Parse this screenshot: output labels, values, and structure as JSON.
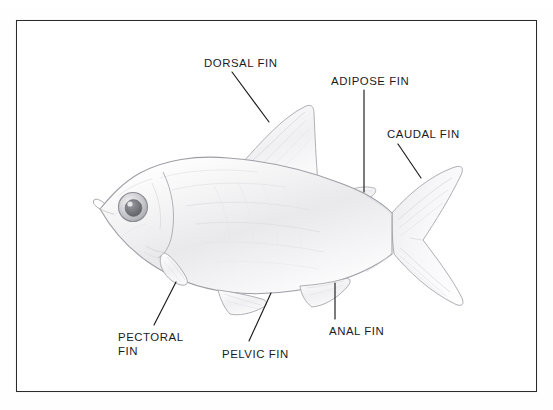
{
  "document": {
    "type": "pencil-drawing-diagram",
    "subject": "Fish external anatomy — fin identification",
    "background_color": "#ffffff",
    "frame_color": "#2b2b2d",
    "ink_color": "#1b1b1d",
    "pencil_color": "#b9babd"
  },
  "scan": {
    "top_sliver_text": "  "
  },
  "labels": [
    {
      "id": "dorsal",
      "text": "DORSAL FIN",
      "lines": [
        "DORSAL FIN"
      ],
      "x": 204,
      "y": 57,
      "leader": {
        "x1": 232,
        "y1": 72,
        "x2": 269,
        "y2": 122
      }
    },
    {
      "id": "adipose",
      "text": "ADIPOSE FIN",
      "lines": [
        "ADIPOSE FIN"
      ],
      "x": 331,
      "y": 75,
      "leader": {
        "x1": 364,
        "y1": 90,
        "x2": 364,
        "y2": 192
      }
    },
    {
      "id": "caudal",
      "text": "CAUDAL FIN",
      "lines": [
        "CAUDAL FIN"
      ],
      "x": 387,
      "y": 128,
      "leader": {
        "x1": 398,
        "y1": 144,
        "x2": 421,
        "y2": 178
      }
    },
    {
      "id": "pectoral",
      "text": "PECTORAL FIN",
      "lines": [
        "PECTORAL",
        "FIN"
      ],
      "x": 118,
      "y": 331,
      "leader": {
        "x1": 176,
        "y1": 282,
        "x2": 154,
        "y2": 325
      }
    },
    {
      "id": "pelvic",
      "text": "PELVIC FIN",
      "lines": [
        "PELVIC FIN"
      ],
      "x": 222,
      "y": 348,
      "leader": {
        "x1": 271,
        "y1": 293,
        "x2": 249,
        "y2": 341
      }
    },
    {
      "id": "anal",
      "text": "ANAL FIN",
      "lines": [
        "ANAL FIN"
      ],
      "x": 329,
      "y": 325,
      "leader": {
        "x1": 335,
        "y1": 283,
        "x2": 335,
        "y2": 319
      }
    }
  ]
}
